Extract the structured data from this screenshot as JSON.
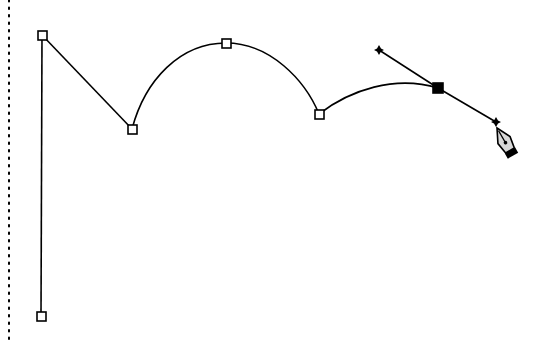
{
  "canvas": {
    "width": 541,
    "height": 344,
    "background": "#ffffff",
    "stroke_color": "#000000"
  },
  "guide": {
    "type": "dotted-vertical-line",
    "x": 9,
    "y1": 0,
    "y2": 344
  },
  "path": {
    "description": "Bezier path drawn with pen tool",
    "anchors": [
      {
        "id": "a0",
        "x": 41,
        "y": 317,
        "selected": false
      },
      {
        "id": "a1",
        "x": 42,
        "y": 35,
        "selected": false
      },
      {
        "id": "a2",
        "x": 132,
        "y": 129,
        "selected": false
      },
      {
        "id": "a3",
        "x": 226,
        "y": 43,
        "selected": false
      },
      {
        "id": "a4",
        "x": 319,
        "y": 114,
        "selected": false
      },
      {
        "id": "a5",
        "x": 438,
        "y": 88,
        "selected": true
      }
    ],
    "segments": [
      {
        "from": "a0",
        "to": "a1",
        "type": "line"
      },
      {
        "from": "a1",
        "to": "a2",
        "type": "line"
      },
      {
        "from": "a2",
        "to": "a3",
        "type": "curve"
      },
      {
        "from": "a3",
        "to": "a4",
        "type": "curve"
      },
      {
        "from": "a4",
        "to": "a5",
        "type": "curve"
      }
    ],
    "direction_handles": [
      {
        "anchor": "a5",
        "x": 379,
        "y": 50
      },
      {
        "anchor": "a5",
        "x": 496,
        "y": 122
      }
    ]
  },
  "cursor": {
    "icon": "pen-tool-cursor",
    "x": 500,
    "y": 150
  }
}
